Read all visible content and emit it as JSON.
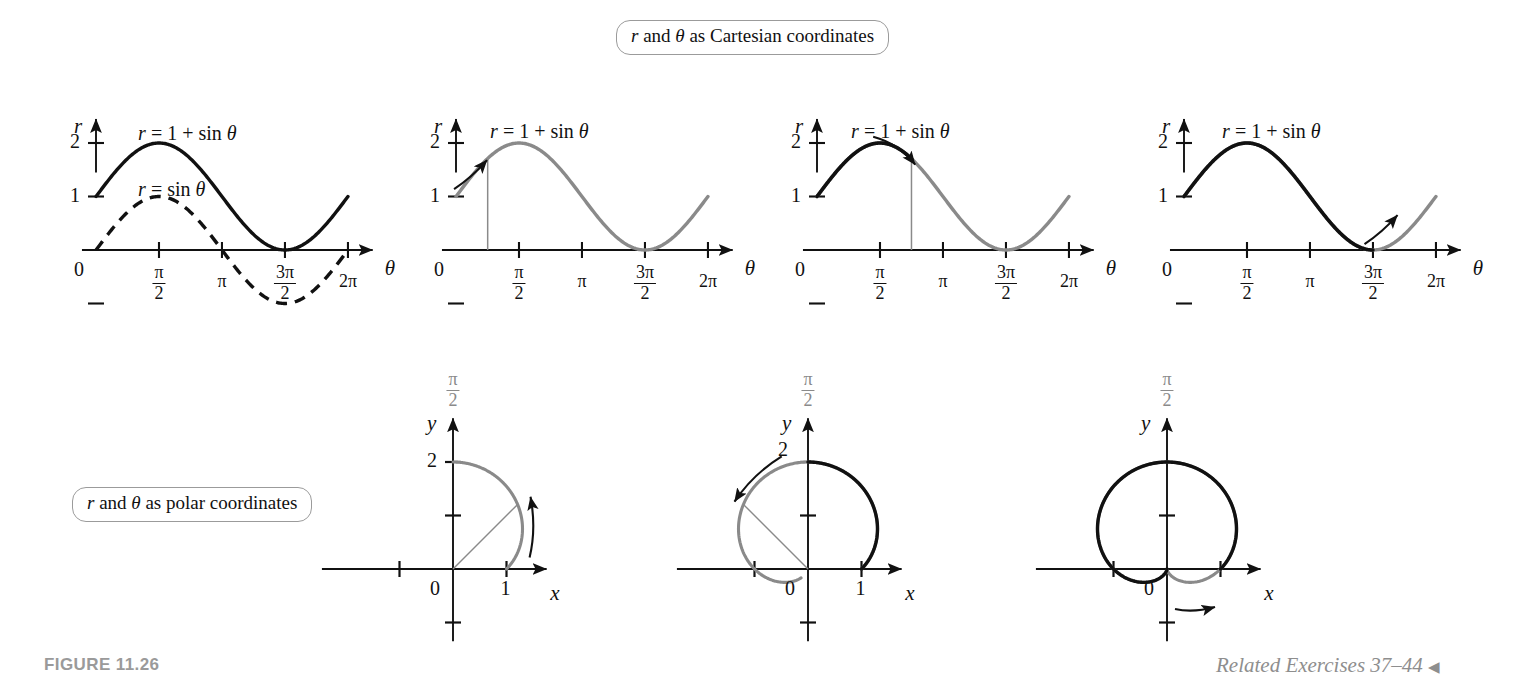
{
  "figure": {
    "number_label": "FIGURE 11.26",
    "related_exercises": "Related Exercises 37–44",
    "related_exercises_marker": "◀"
  },
  "callouts": {
    "cartesian": {
      "r": "r",
      "and": " and ",
      "theta": "θ",
      "rest": " as Cartesian coordinates",
      "full": "r and θ as Cartesian coordinates"
    },
    "polar": {
      "r": "r",
      "and": " and ",
      "theta": "θ",
      "rest": " as polar coordinates",
      "full": "r and θ as polar coordinates"
    }
  },
  "colors": {
    "ink": "#111111",
    "traced": "#111111",
    "untraced": "#8a8a8a",
    "callout_border": "#9b9b9b",
    "caption_grey": "#9a9a9a"
  },
  "cartesian_axis": {
    "y_label": "r",
    "x_label": "θ",
    "origin_label": "0",
    "y_ticks": [
      {
        "value": 1,
        "label": "1"
      },
      {
        "value": 2,
        "label": "2"
      }
    ],
    "x_ticks": [
      {
        "value": 1.5708,
        "label": "π/2",
        "num": "π",
        "den": "2"
      },
      {
        "value": 3.1416,
        "label": "π",
        "num": "π",
        "den": ""
      },
      {
        "value": 4.7124,
        "label": "3π/2",
        "num": "3π",
        "den": "2"
      },
      {
        "value": 6.2832,
        "label": "2π",
        "num": "2π",
        "den": ""
      }
    ],
    "x_range": [
      -0.35,
      7.1
    ],
    "y_range": [
      -1.45,
      2.6
    ]
  },
  "polar_axis": {
    "y_label": "y",
    "x_label": "x",
    "origin_label": "0",
    "top_label_num": "π",
    "top_label_den": "2",
    "x_tick_label": "1",
    "y_tick_label": "2"
  },
  "chart_data": [
    {
      "id": "cartesian-1",
      "type": "line",
      "title": "",
      "xlabel": "θ",
      "ylabel": "r",
      "xlim": [
        0,
        6.2832
      ],
      "ylim": [
        -1,
        2
      ],
      "grid": false,
      "series": [
        {
          "name": "r = 1 + sin θ",
          "label": "r = 1 + sin θ",
          "style": "solid",
          "color": "#111111",
          "formula": "1+sin",
          "theta_start": 0,
          "theta_end": 6.2832,
          "label_x": 1.05,
          "label_y": 2.38
        },
        {
          "name": "r = sin θ",
          "label": "r = sin θ",
          "style": "dashed",
          "color": "#111111",
          "formula": "sin",
          "theta_start": 0,
          "theta_end": 6.2832,
          "label_x": 1.05,
          "label_y": 1.32
        }
      ],
      "annotations": []
    },
    {
      "id": "cartesian-2",
      "type": "line",
      "xlabel": "θ",
      "ylabel": "r",
      "xlim": [
        0,
        6.2832
      ],
      "ylim": [
        -1,
        2
      ],
      "grid": false,
      "series": [
        {
          "name": "r = 1 + sin θ",
          "label": "r = 1 + sin θ",
          "style": "solid",
          "color": "#8a8a8a",
          "formula": "1+sin",
          "theta_start": 0,
          "theta_end": 6.2832,
          "traced_to": 0,
          "label_x": 0.85,
          "label_y": 2.42
        }
      ],
      "annotations": [
        {
          "kind": "marker-line",
          "theta": 0.79,
          "from_r": 0,
          "to_r": 1.71
        },
        {
          "kind": "arrow",
          "direction": "up-right",
          "theta": 0.55,
          "r": 1.55
        }
      ]
    },
    {
      "id": "cartesian-3",
      "type": "line",
      "xlabel": "θ",
      "ylabel": "r",
      "xlim": [
        0,
        6.2832
      ],
      "ylim": [
        -1,
        2
      ],
      "grid": false,
      "series": [
        {
          "name": "r = 1 + sin θ",
          "label": "r = 1 + sin θ",
          "style": "solid",
          "color": "#8a8a8a",
          "formula": "1+sin",
          "theta_start": 0,
          "theta_end": 6.2832,
          "traced_to": 2.356,
          "label_x": 0.85,
          "label_y": 2.42
        }
      ],
      "annotations": [
        {
          "kind": "marker-line",
          "theta": 2.356,
          "from_r": 0,
          "to_r": 1.707
        },
        {
          "kind": "arrow",
          "direction": "down-right",
          "theta": 1.9,
          "r": 1.95
        }
      ]
    },
    {
      "id": "cartesian-4",
      "type": "line",
      "xlabel": "θ",
      "ylabel": "r",
      "xlim": [
        0,
        6.2832
      ],
      "ylim": [
        -1,
        2
      ],
      "grid": false,
      "series": [
        {
          "name": "r = 1 + sin θ",
          "label": "r = 1 + sin θ",
          "style": "solid",
          "color": "#8a8a8a",
          "formula": "1+sin",
          "theta_start": 0,
          "theta_end": 6.2832,
          "traced_to": 4.7124,
          "label_x": 0.95,
          "label_y": 2.42
        }
      ],
      "annotations": [
        {
          "kind": "arrow",
          "direction": "up-right",
          "theta": 5.1,
          "r": 0.52
        }
      ]
    },
    {
      "id": "polar-1",
      "type": "line",
      "plot": "polar",
      "formula": "1+sin",
      "xlabel": "x",
      "ylabel": "y",
      "theta_start": 0,
      "theta_end": 1.5708,
      "traced_to": 0,
      "color": "#8a8a8a",
      "annotations": [
        {
          "kind": "radius-line",
          "theta": 0.785,
          "r": 1.707
        },
        {
          "kind": "arrow",
          "direction": "ccw",
          "theta": 0.45
        }
      ]
    },
    {
      "id": "polar-2",
      "type": "line",
      "plot": "polar",
      "formula": "1+sin",
      "xlabel": "x",
      "ylabel": "y",
      "theta_start": 0,
      "theta_end": 4.05,
      "traced_to": 1.5708,
      "color": "#8a8a8a",
      "annotations": [
        {
          "kind": "radius-line",
          "theta": 2.356,
          "r": 1.707
        },
        {
          "kind": "arrow",
          "direction": "ccw",
          "theta": 2.1
        }
      ]
    },
    {
      "id": "polar-3",
      "type": "line",
      "plot": "polar",
      "formula": "1+sin",
      "xlabel": "x",
      "ylabel": "y",
      "theta_start": 0,
      "theta_end": 6.2832,
      "traced_to": 4.7124,
      "color": "#8a8a8a",
      "annotations": [
        {
          "kind": "arrow",
          "direction": "cw-bottom",
          "theta": 5.6
        }
      ]
    }
  ]
}
